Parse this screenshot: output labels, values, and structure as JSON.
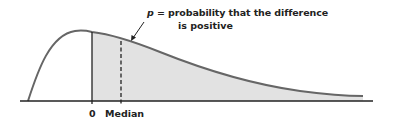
{
  "diagram": {
    "type": "right-skewed probability density curve",
    "annotation": {
      "symbol": "p",
      "line1_rest": " = probability that the difference",
      "line2": "is positive"
    },
    "axis_labels": {
      "zero": "0",
      "median": "Median"
    },
    "colors": {
      "curve": "#666666",
      "shaded_area": "#e2e2e2",
      "axis": "#222222",
      "text": "#222222"
    },
    "shaded_region": "area under curve to the right of 0"
  }
}
